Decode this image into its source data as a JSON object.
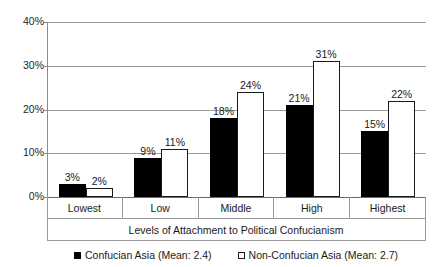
{
  "chart_data": {
    "type": "bar",
    "title": "",
    "xlabel": "Levels of Attachment to Political Confucianism",
    "ylabel": "",
    "categories": [
      "Lowest",
      "Low",
      "Middle",
      "High",
      "Highest"
    ],
    "ylim": [
      0,
      40
    ],
    "ytick_labels": [
      "0%",
      "10%",
      "20%",
      "30%",
      "40%"
    ],
    "ytick_values": [
      0,
      10,
      20,
      30,
      40
    ],
    "grid": true,
    "legend_position": "bottom",
    "value_label_suffix": "%",
    "series": [
      {
        "name": "Confucian Asia (Mean: 2.4)",
        "style": "filled",
        "color": "#000000",
        "values": [
          3,
          9,
          18,
          21,
          15
        ],
        "value_labels": [
          "3%",
          "9%",
          "18%",
          "21%",
          "15%"
        ]
      },
      {
        "name": "Non-Confucian Asia (Mean: 2.7)",
        "style": "hollow",
        "color": "#ffffff",
        "border_color": "#1a1a1a",
        "values": [
          2,
          11,
          24,
          31,
          22
        ],
        "value_labels": [
          "2%",
          "11%",
          "24%",
          "31%",
          "22%"
        ]
      }
    ]
  },
  "legend": {
    "items": [
      {
        "label": "Confucian Asia (Mean: 2.4)",
        "swatch": "filled-square-icon"
      },
      {
        "label": "Non-Confucian Asia (Mean: 2.7)",
        "swatch": "hollow-square-icon"
      }
    ]
  }
}
